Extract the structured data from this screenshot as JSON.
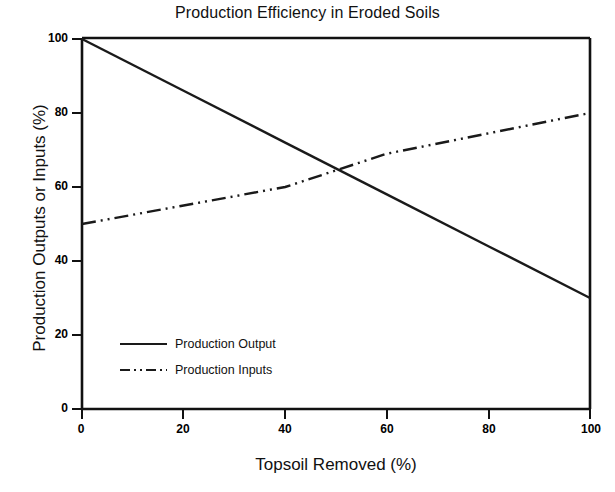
{
  "chart_data": {
    "type": "line",
    "title": "Production Efficiency in Eroded Soils",
    "xlabel": "Topsoil Removed (%)",
    "ylabel": "Production Outputs or Inputs (%)",
    "xlim": [
      0,
      100
    ],
    "ylim": [
      0,
      100
    ],
    "xticks": [
      0,
      20,
      40,
      60,
      80,
      100
    ],
    "yticks": [
      0,
      20,
      40,
      60,
      80,
      100
    ],
    "xtick_labels": [
      "0",
      "20",
      "40",
      "60",
      "80",
      "100"
    ],
    "ytick_labels": [
      "0",
      "20",
      "40",
      "60",
      "80",
      "100"
    ],
    "grid": false,
    "legend_position": "lower left inside",
    "series": [
      {
        "name": "Production Output",
        "style": "solid",
        "color": "#1a1a1a",
        "x": [
          0,
          20,
          40,
          60,
          80,
          100
        ],
        "y": [
          100,
          86,
          72,
          58,
          44,
          30
        ]
      },
      {
        "name": "Production Inputs",
        "style": "dash-dot-dot",
        "color": "#1a1a1a",
        "x": [
          0,
          20,
          40,
          50,
          60,
          80,
          100
        ],
        "y": [
          50,
          55,
          60,
          64.5,
          69,
          74.5,
          80
        ]
      }
    ]
  },
  "legend": {
    "items": [
      {
        "label": "Production Output",
        "style": "solid"
      },
      {
        "label": "Production Inputs",
        "style": "dash-dot-dot"
      }
    ]
  }
}
